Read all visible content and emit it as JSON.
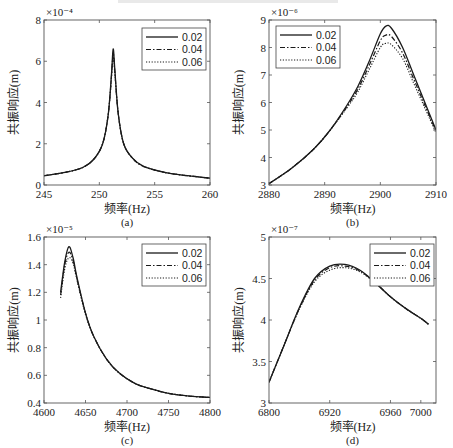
{
  "chart_data": [
    {
      "id": "a",
      "type": "line",
      "caption": "(a)",
      "xlabel": "频率(Hz)",
      "ylabel": "共振响应(m)",
      "y_exponent": "×10⁻⁴",
      "xlim": [
        245,
        260
      ],
      "ylim": [
        0,
        8
      ],
      "xticks": [
        245,
        250,
        255,
        260
      ],
      "yticks": [
        0,
        2,
        4,
        6,
        8
      ],
      "legend": [
        "0.02",
        "0.04",
        "0.06"
      ],
      "legend_position": "upper right",
      "series": [
        {
          "name": "0.02",
          "style": "solid",
          "x": [
            245,
            247,
            248.5,
            249.5,
            250.3,
            250.8,
            251.1,
            251.25,
            251.4,
            251.7,
            252.2,
            253,
            254,
            256,
            258,
            260
          ],
          "y": [
            0.45,
            0.62,
            0.85,
            1.25,
            2.0,
            3.4,
            5.4,
            6.6,
            5.6,
            3.5,
            2.0,
            1.3,
            0.9,
            0.6,
            0.45,
            0.33
          ]
        },
        {
          "name": "0.04",
          "style": "dashdot",
          "x": [
            245,
            247,
            248.5,
            249.5,
            250.3,
            250.8,
            251.1,
            251.25,
            251.4,
            251.7,
            252.2,
            253,
            254,
            256,
            258,
            260
          ],
          "y": [
            0.45,
            0.62,
            0.85,
            1.25,
            2.0,
            3.4,
            5.3,
            6.4,
            5.5,
            3.5,
            2.0,
            1.3,
            0.9,
            0.6,
            0.45,
            0.33
          ]
        },
        {
          "name": "0.06",
          "style": "dotted",
          "x": [
            245,
            247,
            248.5,
            249.5,
            250.3,
            250.8,
            251.1,
            251.25,
            251.4,
            251.7,
            252.2,
            253,
            254,
            256,
            258,
            260
          ],
          "y": [
            0.45,
            0.62,
            0.85,
            1.25,
            2.0,
            3.4,
            5.2,
            6.2,
            5.4,
            3.5,
            2.0,
            1.3,
            0.9,
            0.6,
            0.45,
            0.33
          ]
        }
      ]
    },
    {
      "id": "b",
      "type": "line",
      "caption": "(b)",
      "xlabel": "频率(Hz)",
      "ylabel": "共振响应(m)",
      "y_exponent": "×10⁻⁶",
      "xlim": [
        2880,
        2910
      ],
      "ylim": [
        3,
        9
      ],
      "xticks": [
        2880,
        2890,
        2900,
        2910
      ],
      "yticks": [
        3,
        4,
        5,
        6,
        7,
        8,
        9
      ],
      "legend": [
        "0.02",
        "0.04",
        "0.06"
      ],
      "legend_position": "upper left",
      "series": [
        {
          "name": "0.02",
          "style": "solid",
          "x": [
            2880,
            2884,
            2888,
            2891,
            2894,
            2896,
            2898,
            2900,
            2901,
            2902,
            2904,
            2906,
            2908,
            2910
          ],
          "y": [
            3.05,
            3.6,
            4.3,
            5.0,
            5.9,
            6.6,
            7.5,
            8.5,
            8.78,
            8.7,
            8.0,
            7.0,
            6.0,
            5.0
          ]
        },
        {
          "name": "0.04",
          "style": "dashdot",
          "x": [
            2880,
            2884,
            2888,
            2891,
            2894,
            2896,
            2898,
            2900,
            2901,
            2902,
            2904,
            2906,
            2908,
            2910
          ],
          "y": [
            3.05,
            3.6,
            4.3,
            5.0,
            5.85,
            6.5,
            7.35,
            8.25,
            8.45,
            8.4,
            7.8,
            6.85,
            5.9,
            4.95
          ]
        },
        {
          "name": "0.06",
          "style": "dotted",
          "x": [
            2880,
            2884,
            2888,
            2891,
            2894,
            2896,
            2898,
            2900,
            2901,
            2902,
            2904,
            2906,
            2908,
            2910
          ],
          "y": [
            3.05,
            3.6,
            4.3,
            5.0,
            5.8,
            6.4,
            7.2,
            8.0,
            8.15,
            8.1,
            7.6,
            6.7,
            5.8,
            4.9
          ]
        }
      ]
    },
    {
      "id": "c",
      "type": "line",
      "caption": "(c)",
      "xlabel": "频率(Hz)",
      "ylabel": "共振响应(m)",
      "y_exponent": "×10⁻⁵",
      "xlim": [
        4600,
        4800
      ],
      "ylim": [
        0.4,
        1.6
      ],
      "xticks": [
        4600,
        4650,
        4700,
        4750,
        4800
      ],
      "yticks": [
        0.4,
        0.6,
        0.8,
        1,
        1.2,
        1.4,
        1.6
      ],
      "legend": [
        "0.02",
        "0.04",
        "0.06"
      ],
      "legend_position": "upper right",
      "series": [
        {
          "name": "0.02",
          "style": "solid",
          "x": [
            4620,
            4625,
            4630,
            4635,
            4640,
            4650,
            4660,
            4675,
            4690,
            4710,
            4730,
            4750,
            4775,
            4800
          ],
          "y": [
            1.2,
            1.42,
            1.53,
            1.45,
            1.3,
            1.05,
            0.88,
            0.72,
            0.62,
            0.54,
            0.5,
            0.47,
            0.45,
            0.44
          ]
        },
        {
          "name": "0.04",
          "style": "dashdot",
          "x": [
            4620,
            4625,
            4630,
            4635,
            4640,
            4650,
            4660,
            4675,
            4690,
            4710,
            4730,
            4750,
            4775,
            4800
          ],
          "y": [
            1.18,
            1.4,
            1.49,
            1.43,
            1.29,
            1.05,
            0.88,
            0.72,
            0.62,
            0.54,
            0.5,
            0.47,
            0.45,
            0.44
          ]
        },
        {
          "name": "0.06",
          "style": "dotted",
          "x": [
            4620,
            4625,
            4630,
            4635,
            4640,
            4650,
            4660,
            4675,
            4690,
            4710,
            4730,
            4750,
            4775,
            4800
          ],
          "y": [
            1.16,
            1.37,
            1.45,
            1.41,
            1.28,
            1.04,
            0.88,
            0.72,
            0.62,
            0.54,
            0.5,
            0.47,
            0.45,
            0.44
          ]
        }
      ]
    },
    {
      "id": "d",
      "type": "line",
      "caption": "(d)",
      "xlabel": "频率(Hz)",
      "ylabel": "共振响应(m)",
      "y_exponent": "×10⁻⁷",
      "xlim": [
        6800,
        7020
      ],
      "ylim": [
        3,
        5
      ],
      "xticks": [
        6800,
        6920,
        6960,
        7000
      ],
      "xtick_positions": [
        6800,
        6880,
        6960,
        7000
      ],
      "yticks": [
        3,
        3.5,
        4,
        4.5,
        5
      ],
      "legend": [
        "0.02",
        "0.04",
        "0.06"
      ],
      "legend_position": "upper right",
      "series": [
        {
          "name": "0.02",
          "style": "solid",
          "x": [
            6800,
            6820,
            6840,
            6860,
            6880,
            6900,
            6920,
            6940,
            6960,
            6980,
            7000,
            7010
          ],
          "y": [
            3.25,
            3.7,
            4.15,
            4.5,
            4.65,
            4.67,
            4.6,
            4.45,
            4.28,
            4.14,
            4.02,
            3.95
          ]
        },
        {
          "name": "0.04",
          "style": "dashdot",
          "x": [
            6800,
            6820,
            6840,
            6860,
            6880,
            6900,
            6920,
            6940,
            6960,
            6980,
            7000,
            7010
          ],
          "y": [
            3.25,
            3.7,
            4.14,
            4.48,
            4.63,
            4.65,
            4.59,
            4.45,
            4.28,
            4.14,
            4.02,
            3.95
          ]
        },
        {
          "name": "0.06",
          "style": "dotted",
          "x": [
            6800,
            6820,
            6840,
            6860,
            6880,
            6900,
            6920,
            6940,
            6960,
            6980,
            7000,
            7010
          ],
          "y": [
            3.25,
            3.7,
            4.13,
            4.46,
            4.6,
            4.63,
            4.58,
            4.44,
            4.28,
            4.14,
            4.02,
            3.95
          ]
        }
      ]
    }
  ]
}
